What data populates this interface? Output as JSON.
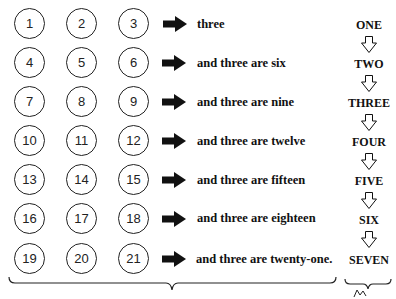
{
  "diagram": {
    "type": "three-times-table",
    "rows": [
      {
        "numbers": [
          "1",
          "2",
          "3"
        ],
        "phrase": "three",
        "word": "ONE"
      },
      {
        "numbers": [
          "4",
          "5",
          "6"
        ],
        "phrase": "and three are six",
        "word": "TWO"
      },
      {
        "numbers": [
          "7",
          "8",
          "9"
        ],
        "phrase": "and three are nine",
        "word": "THREE"
      },
      {
        "numbers": [
          "10",
          "11",
          "12"
        ],
        "phrase": "and three are twelve",
        "word": "FOUR"
      },
      {
        "numbers": [
          "13",
          "14",
          "15"
        ],
        "phrase": "and three are fifteen",
        "word": "FIVE"
      },
      {
        "numbers": [
          "16",
          "17",
          "18"
        ],
        "phrase": "and three are eighteen",
        "word": "SIX"
      },
      {
        "numbers": [
          "19",
          "20",
          "21"
        ],
        "phrase": "and three are twenty-one.",
        "word": "SEVEN"
      }
    ],
    "icons": {
      "row_arrow": "solid-right-arrow",
      "word_arrow": "hollow-down-arrow",
      "bottom_left": "curly-brace",
      "bottom_right": "curly-brace-with-squiggle"
    },
    "colors": {
      "ink": "#111111",
      "background": "#ffffff"
    }
  }
}
